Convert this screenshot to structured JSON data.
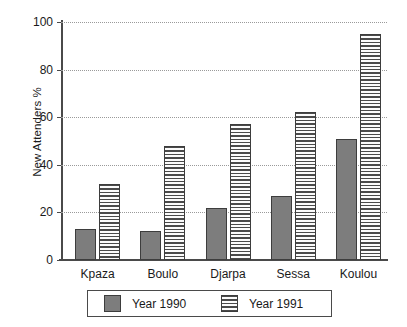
{
  "chart_data": {
    "type": "bar",
    "title": "",
    "xlabel": "",
    "ylabel": "New Attenders %",
    "ylim": [
      0,
      100
    ],
    "yticks": [
      0,
      20,
      40,
      60,
      80,
      100
    ],
    "ytick_labels": [
      "0",
      "20",
      "40",
      "60",
      "80",
      "100"
    ],
    "grid": true,
    "grid_style": "dotted-horizontal",
    "legend_position": "below-axes",
    "categories": [
      "Kpaza",
      "Boulo",
      "Djarpa",
      "Sessa",
      "Koulou"
    ],
    "series": [
      {
        "name": "Year 1990",
        "fill": "solid-gray",
        "color": "#7d7d7d",
        "values": [
          13,
          12,
          22,
          27,
          51
        ]
      },
      {
        "name": "Year 1991",
        "fill": "horizontal-hatch",
        "color": "#f2f2f2",
        "values": [
          32,
          48,
          57,
          62,
          95
        ]
      }
    ]
  },
  "legend": {
    "entries": [
      {
        "label": "Year 1990"
      },
      {
        "label": "Year 1991"
      }
    ]
  },
  "colors": {
    "axis": "#4a4a4a",
    "grid": "#9a9a9a",
    "bar_1990": "#7d7d7d",
    "bar_1991": "#f2f2f2",
    "bar_edge": "#3d3d3d",
    "text": "#1a1a1a",
    "background": "#ffffff"
  }
}
